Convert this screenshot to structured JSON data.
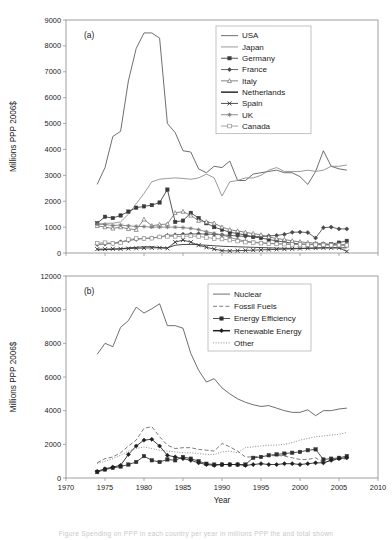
{
  "figure": {
    "panels": [
      {
        "tag": "(a)",
        "ylabel": "Millions PPP 2006$",
        "xlabel": "",
        "ylim": [
          0,
          9000
        ],
        "yticks": [
          0,
          1000,
          2000,
          3000,
          4000,
          5000,
          6000,
          7000,
          8000,
          9000
        ],
        "xlim": [
          1970,
          2010
        ],
        "xticks": [
          1970,
          1975,
          1980,
          1985,
          1990,
          1995,
          2000,
          2005,
          2010
        ],
        "xtick_labels_visible": false,
        "legend_position": "top-right"
      },
      {
        "tag": "(b)",
        "ylabel": "Millions PPP 2006$",
        "xlabel": "Year",
        "ylim": [
          0,
          12000
        ],
        "yticks": [
          0,
          2000,
          4000,
          6000,
          8000,
          10000,
          12000
        ],
        "xlim": [
          1970,
          2010
        ],
        "xticks": [
          1970,
          1975,
          1980,
          1985,
          1990,
          1995,
          2000,
          2005,
          2010
        ],
        "xtick_labels_visible": true,
        "legend_position": "top-right"
      }
    ],
    "caption": "Figure  Spending on PPP  in each country per year  in millions PPP the and total shown"
  },
  "chart_data": [
    {
      "type": "line",
      "title": "(a)",
      "xlabel": "",
      "ylabel": "Millions PPP 2006$",
      "xlim": [
        1970,
        2010
      ],
      "ylim": [
        0,
        9000
      ],
      "grid": false,
      "legend": "top-right",
      "x": [
        1974,
        1975,
        1976,
        1977,
        1978,
        1979,
        1980,
        1981,
        1982,
        1983,
        1984,
        1985,
        1986,
        1987,
        1988,
        1989,
        1990,
        1991,
        1992,
        1993,
        1994,
        1995,
        1996,
        1997,
        1998,
        1999,
        2000,
        2001,
        2002,
        2003,
        2004,
        2005,
        2006
      ],
      "series": [
        {
          "name": "USA",
          "marker": "none",
          "style": "solid",
          "color": "#555555",
          "values": [
            2650,
            3300,
            4500,
            4700,
            6650,
            7900,
            8500,
            8500,
            8300,
            5000,
            4650,
            3950,
            3900,
            3250,
            3100,
            3350,
            3300,
            3550,
            2800,
            2800,
            3050,
            3100,
            3150,
            3200,
            3100,
            3100,
            2950,
            2650,
            3150,
            3950,
            3350,
            3250,
            3200
          ]
        },
        {
          "name": "Japan",
          "marker": "none",
          "style": "solid",
          "color": "#888888",
          "values": [
            1100,
            1150,
            1150,
            1200,
            1500,
            1900,
            2300,
            2750,
            2850,
            2880,
            2900,
            2880,
            2850,
            2900,
            3050,
            2900,
            2200,
            2750,
            2800,
            2900,
            2900,
            3000,
            3200,
            3300,
            3150,
            3150,
            3150,
            3200,
            3150,
            3200,
            3350,
            3350,
            3400
          ]
        },
        {
          "name": "Germany",
          "marker": "square-filled",
          "style": "solid",
          "color": "#3a3a3a",
          "values": [
            1150,
            1400,
            1350,
            1450,
            1600,
            1750,
            1800,
            1850,
            1950,
            2450,
            1200,
            1250,
            1550,
            1350,
            1150,
            1000,
            900,
            800,
            750,
            700,
            620,
            580,
            520,
            470,
            420,
            380,
            350,
            330,
            340,
            330,
            340,
            400,
            470
          ]
        },
        {
          "name": "France",
          "marker": "diamond-filled",
          "style": "solid",
          "color": "#4a4a4a",
          "values": [
            330,
            350,
            370,
            430,
            480,
            530,
            560,
            580,
            620,
            680,
            700,
            720,
            730,
            740,
            730,
            720,
            700,
            680,
            660,
            640,
            630,
            640,
            660,
            680,
            720,
            800,
            810,
            790,
            580,
            980,
            1000,
            930,
            930
          ]
        },
        {
          "name": "Italy",
          "marker": "triangle",
          "style": "solid",
          "color": "#6e6e6e",
          "values": [
            1050,
            1000,
            950,
            1000,
            930,
            900,
            1300,
            1050,
            1100,
            1120,
            1550,
            1600,
            1450,
            1250,
            1200,
            1150,
            1000,
            900,
            850,
            800,
            750,
            700,
            620,
            560,
            520,
            470,
            430,
            400,
            380,
            360,
            330,
            320,
            300
          ]
        },
        {
          "name": "Netherlands",
          "marker": "none",
          "style": "solid-thick",
          "color": "#2a2a2a",
          "values": [
            120,
            130,
            140,
            160,
            200,
            220,
            240,
            240,
            210,
            200,
            300,
            330,
            330,
            320,
            300,
            280,
            260,
            250,
            240,
            230,
            220,
            210,
            200,
            190,
            180,
            180,
            180,
            190,
            190,
            200,
            200,
            200,
            200
          ]
        },
        {
          "name": "Spain",
          "marker": "cross",
          "style": "solid",
          "color": "#333333",
          "values": [
            150,
            150,
            160,
            160,
            170,
            180,
            190,
            200,
            200,
            180,
            420,
            500,
            420,
            300,
            220,
            150,
            90,
            80,
            90,
            100,
            110,
            120,
            130,
            140,
            150,
            160,
            170,
            180,
            190,
            200,
            200,
            200,
            60
          ]
        },
        {
          "name": "UK",
          "marker": "star",
          "style": "solid",
          "color": "#7a7a7a",
          "values": [
            1120,
            1100,
            1060,
            1080,
            1050,
            1030,
            1020,
            1000,
            1000,
            1000,
            1000,
            980,
            950,
            900,
            820,
            760,
            700,
            600,
            520,
            460,
            420,
            400,
            380,
            360,
            350,
            340,
            330,
            330,
            330,
            330,
            320,
            320,
            320
          ]
        },
        {
          "name": "Canada",
          "marker": "square-open",
          "style": "solid",
          "color": "#909090",
          "values": [
            380,
            400,
            370,
            390,
            520,
            560,
            560,
            570,
            620,
            640,
            640,
            640,
            660,
            640,
            600,
            560,
            540,
            500,
            460,
            420,
            400,
            380,
            360,
            350,
            340,
            330,
            330,
            320,
            320,
            310,
            300,
            300,
            300
          ]
        }
      ]
    },
    {
      "type": "line",
      "title": "(b)",
      "xlabel": "Year",
      "ylabel": "Millions PPP 2006$",
      "xlim": [
        1970,
        2010
      ],
      "ylim": [
        0,
        12000
      ],
      "grid": false,
      "legend": "top-right",
      "x": [
        1974,
        1975,
        1976,
        1977,
        1978,
        1979,
        1980,
        1981,
        1982,
        1983,
        1984,
        1985,
        1986,
        1987,
        1988,
        1989,
        1990,
        1991,
        1992,
        1993,
        1994,
        1995,
        1996,
        1997,
        1998,
        1999,
        2000,
        2001,
        2002,
        2003,
        2004,
        2005,
        2006
      ],
      "series": [
        {
          "name": "Nuclear",
          "marker": "none",
          "style": "solid",
          "color": "#555555",
          "values": [
            7350,
            8000,
            7800,
            8950,
            9350,
            10150,
            9800,
            10050,
            10350,
            9050,
            9050,
            8900,
            7400,
            6400,
            5700,
            5900,
            5350,
            5000,
            4700,
            4500,
            4350,
            4250,
            4300,
            4150,
            4000,
            3900,
            3900,
            4050,
            3700,
            4000,
            4000,
            4100,
            4150
          ]
        },
        {
          "name": "Fossil Fuels",
          "marker": "none",
          "style": "dashed",
          "color": "#666666",
          "values": [
            900,
            1150,
            1250,
            1500,
            1900,
            2250,
            2950,
            3050,
            2450,
            1950,
            1750,
            1800,
            1800,
            1700,
            1650,
            1600,
            2050,
            1850,
            1600,
            1250,
            1250,
            1300,
            1300,
            1350,
            1300,
            1200,
            1100,
            1100,
            1200,
            900,
            1050,
            1100,
            1150
          ]
        },
        {
          "name": "Energy Efficiency",
          "marker": "square-filled",
          "style": "solid",
          "color": "#2f2f2f",
          "values": [
            350,
            500,
            600,
            680,
            800,
            950,
            1300,
            1050,
            950,
            1100,
            1050,
            1250,
            1150,
            1000,
            850,
            800,
            800,
            800,
            800,
            800,
            1200,
            1250,
            1350,
            1400,
            1450,
            1500,
            1550,
            1650,
            1700,
            1100,
            1150,
            1200,
            1300
          ]
        },
        {
          "name": "Renewable Energy",
          "marker": "diamond-filled",
          "style": "solid-thick",
          "color": "#1f1f1f",
          "values": [
            400,
            550,
            650,
            750,
            1400,
            1900,
            2250,
            2300,
            1900,
            1350,
            1250,
            1150,
            1050,
            900,
            800,
            750,
            800,
            800,
            800,
            750,
            800,
            850,
            800,
            800,
            850,
            850,
            800,
            850,
            900,
            900,
            1050,
            1150,
            1200
          ]
        },
        {
          "name": "Other",
          "marker": "none",
          "style": "dotted",
          "color": "#777777",
          "values": [
            850,
            1000,
            1150,
            1350,
            1600,
            1750,
            1850,
            1750,
            1650,
            1600,
            1550,
            1500,
            1500,
            1450,
            1400,
            1400,
            1550,
            1600,
            1500,
            1800,
            1850,
            1900,
            1950,
            1950,
            2000,
            2100,
            2250,
            2350,
            2450,
            2500,
            2550,
            2600,
            2700
          ]
        }
      ]
    }
  ]
}
